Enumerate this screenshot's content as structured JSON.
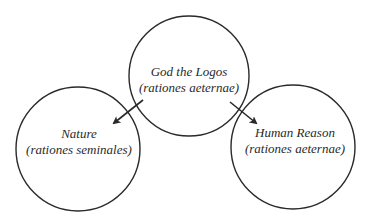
{
  "diagram": {
    "colors": {
      "stroke": "#2a2a2a",
      "text": "#2a2a2a",
      "background": "#ffffff"
    },
    "nodes": [
      {
        "id": "god",
        "title": "God the Logos",
        "subtitle": "(rationes aeternae)",
        "cx": 189,
        "cy": 76,
        "r": 60
      },
      {
        "id": "nature",
        "title": "Nature",
        "subtitle": "(rationes seminales)",
        "cx": 78,
        "cy": 149,
        "r": 62
      },
      {
        "id": "human-reason",
        "title": "Human Reason",
        "subtitle": "(rationes aeternae)",
        "cx": 293,
        "cy": 147,
        "r": 62
      }
    ],
    "edges": [
      {
        "from": "god",
        "to": "nature"
      },
      {
        "from": "god",
        "to": "human-reason"
      }
    ]
  }
}
